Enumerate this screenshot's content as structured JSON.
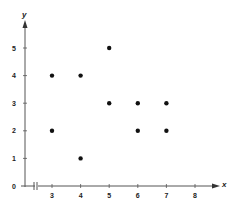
{
  "chart_data": {
    "type": "scatter",
    "title": "",
    "xlabel": "x",
    "ylabel": "y",
    "xlim": [
      0,
      8
    ],
    "ylim": [
      0,
      5
    ],
    "x_axis_break": true,
    "x_ticks": [
      3,
      4,
      5,
      6,
      7,
      8
    ],
    "y_ticks": [
      0,
      1,
      2,
      3,
      4,
      5
    ],
    "grid": false,
    "legend": null,
    "points": [
      {
        "x": 3,
        "y": 4
      },
      {
        "x": 3,
        "y": 2
      },
      {
        "x": 4,
        "y": 4
      },
      {
        "x": 4,
        "y": 1
      },
      {
        "x": 5,
        "y": 5
      },
      {
        "x": 5,
        "y": 3
      },
      {
        "x": 6,
        "y": 3
      },
      {
        "x": 6,
        "y": 2
      },
      {
        "x": 7,
        "y": 3
      },
      {
        "x": 7,
        "y": 2
      }
    ],
    "colors": {
      "axis": "#555555",
      "point": "#111111",
      "text": "#222222"
    }
  }
}
